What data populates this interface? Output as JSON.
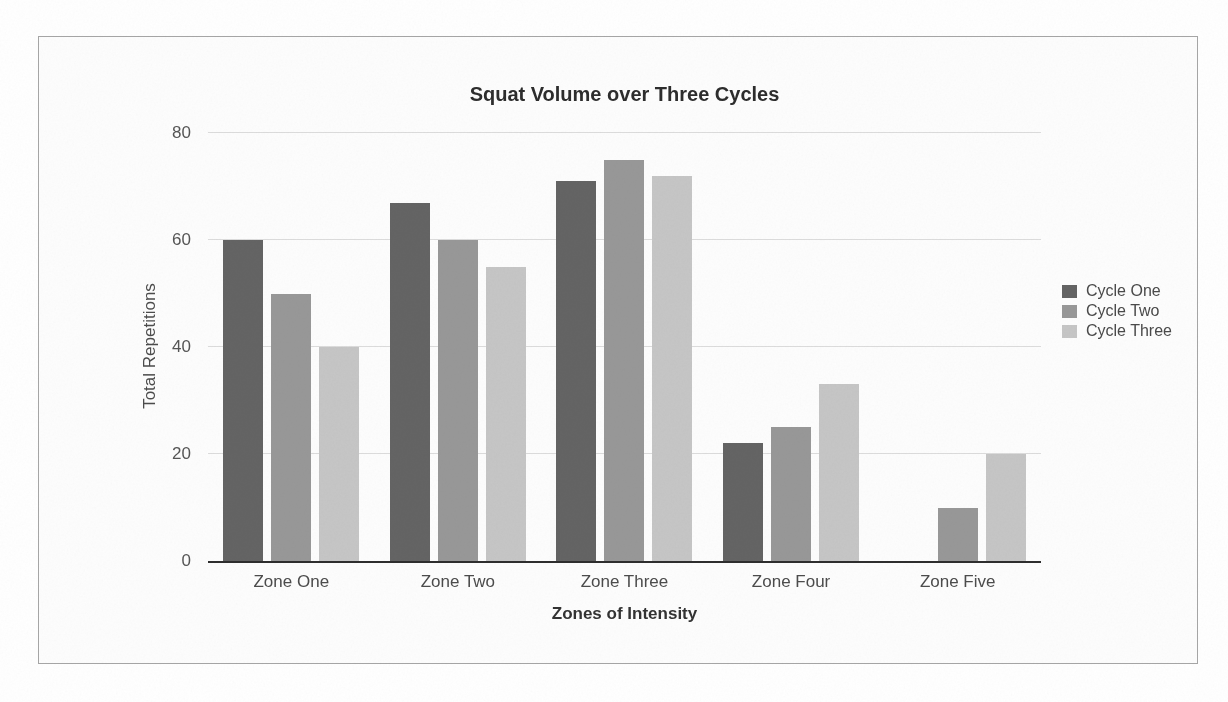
{
  "chart_data": {
    "type": "bar",
    "title": "Squat Volume over Three Cycles",
    "xlabel": "Zones of Intensity",
    "ylabel": "Total Repetitions",
    "categories": [
      "Zone One",
      "Zone Two",
      "Zone Three",
      "Zone Four",
      "Zone Five"
    ],
    "series": [
      {
        "name": "Cycle One",
        "color": "#646464",
        "values": [
          60,
          67,
          71,
          22,
          0
        ]
      },
      {
        "name": "Cycle Two",
        "color": "#989898",
        "values": [
          50,
          60,
          75,
          25,
          10
        ]
      },
      {
        "name": "Cycle Three",
        "color": "#c6c6c6",
        "values": [
          40,
          55,
          72,
          33,
          20
        ]
      }
    ],
    "ylim": [
      0,
      80
    ],
    "yticks": [
      0,
      20,
      40,
      60,
      80
    ],
    "grid": "horizontal",
    "legend_position": "right",
    "axis_line_color": "#2e2e2e",
    "gridline_color": "#dcdcdc"
  },
  "frame": {
    "border_color": "#a6a6a6"
  }
}
